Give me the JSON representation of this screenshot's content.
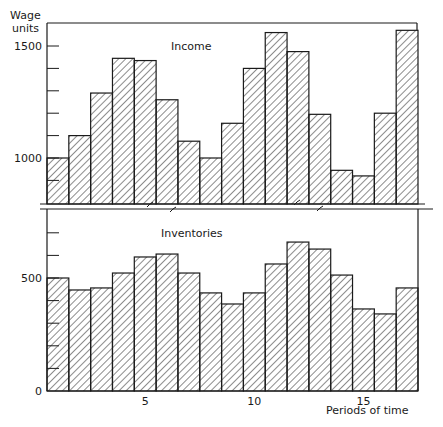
{
  "chart_data": [
    {
      "type": "bar",
      "title": "Income",
      "ylabel": "Wage units",
      "xlabel": "",
      "categories": [
        1,
        2,
        3,
        4,
        5,
        6,
        7,
        8,
        9,
        10,
        11,
        12,
        13,
        14,
        15,
        16,
        17
      ],
      "values": [
        1000,
        1100,
        1290,
        1445,
        1435,
        1260,
        1075,
        1000,
        1155,
        1400,
        1560,
        1475,
        1195,
        945,
        920,
        1200,
        1570
      ],
      "ylim": [
        820,
        1580
      ],
      "yticks": [
        900,
        1000,
        1100,
        1200,
        1300,
        1400,
        1500
      ],
      "ytick_labels": [
        "1000",
        "1500"
      ],
      "ytick_label_values": [
        1000,
        1500
      ],
      "hatch": "diagonal",
      "axis_break": true,
      "grid": false,
      "legend": null
    },
    {
      "type": "bar",
      "title": "Inventories",
      "ylabel": "",
      "xlabel": "Periods of time",
      "categories": [
        1,
        2,
        3,
        4,
        5,
        6,
        7,
        8,
        9,
        10,
        11,
        12,
        13,
        14,
        15,
        16,
        17
      ],
      "values": [
        500,
        447,
        456,
        522,
        593,
        606,
        522,
        434,
        385,
        434,
        562,
        659,
        628,
        513,
        363,
        341,
        456
      ],
      "ylim": [
        0,
        800
      ],
      "yticks": [
        0,
        100,
        200,
        300,
        400,
        500,
        600,
        700
      ],
      "ytick_labels": [
        "0",
        "500"
      ],
      "ytick_label_values": [
        0,
        500
      ],
      "xtick_labels": [
        "5",
        "10",
        "15"
      ],
      "xtick_values": [
        5,
        10,
        15
      ],
      "hatch": "diagonal",
      "grid": false,
      "legend": null
    }
  ],
  "labels": {
    "y_axis_top_line1": "Wage",
    "y_axis_top_line2": "units",
    "top_title": "Income",
    "bottom_title": "Inventories",
    "x_axis_label": "Periods of time"
  },
  "colors": {
    "ink": "#1a1a1a",
    "background": "#ffffff"
  }
}
